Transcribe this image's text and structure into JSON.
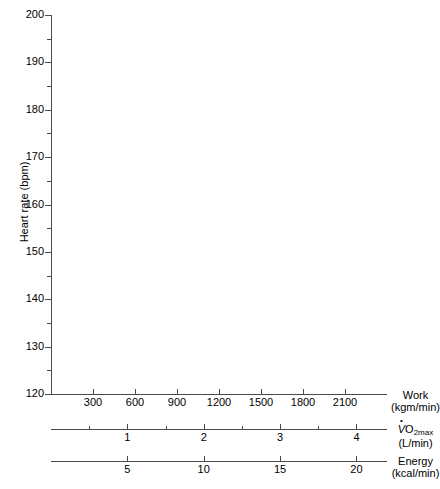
{
  "chart_data": {
    "type": "line",
    "title": "",
    "subtitle": "",
    "series": [],
    "grid": false,
    "legend": null,
    "yaxis": {
      "label": "Heart rate (bpm)",
      "ylim": [
        120,
        200
      ],
      "major_step": 10,
      "minor_step": 5,
      "ticks": [
        120,
        130,
        140,
        150,
        160,
        170,
        180,
        190,
        200
      ],
      "tick_labels": [
        "120",
        "130",
        "140",
        "150",
        "160",
        "170",
        "180",
        "190",
        "200"
      ],
      "minor_ticks": [
        125,
        135,
        145,
        155,
        165,
        175,
        185,
        195
      ]
    },
    "xaxes": [
      {
        "name": "work",
        "label_line1": "Work",
        "label_line2": "(kgm/min)",
        "xlim": [
          0,
          2400
        ],
        "ticks": [
          300,
          600,
          900,
          1200,
          1500,
          1800,
          2100
        ],
        "tick_labels": [
          "300",
          "600",
          "900",
          "1200",
          "1500",
          "1800",
          "2100"
        ],
        "minor_ticks": []
      },
      {
        "name": "vo2max",
        "label_line1": "VO2max",
        "label_line2": "(L/min)",
        "xlim": [
          0,
          4.4
        ],
        "ticks": [
          1,
          2,
          3,
          4
        ],
        "tick_labels": [
          "1",
          "2",
          "3",
          "4"
        ],
        "minor_ticks": [
          0.5,
          1.5,
          2.5,
          3.5
        ]
      },
      {
        "name": "energy",
        "label_line1": "Energy",
        "label_line2": "(kcal/min)",
        "xlim": [
          0,
          22
        ],
        "ticks": [
          5,
          10,
          15,
          20
        ],
        "tick_labels": [
          "5",
          "10",
          "15",
          "20"
        ],
        "minor_ticks": []
      }
    ],
    "colors": {
      "axis": "#4a4a4a",
      "text": "#000000",
      "background": "#ffffff"
    }
  },
  "vo2_caption": {
    "v": "V",
    "o": "O",
    "sub": "2max",
    "units": "(L/min)"
  }
}
